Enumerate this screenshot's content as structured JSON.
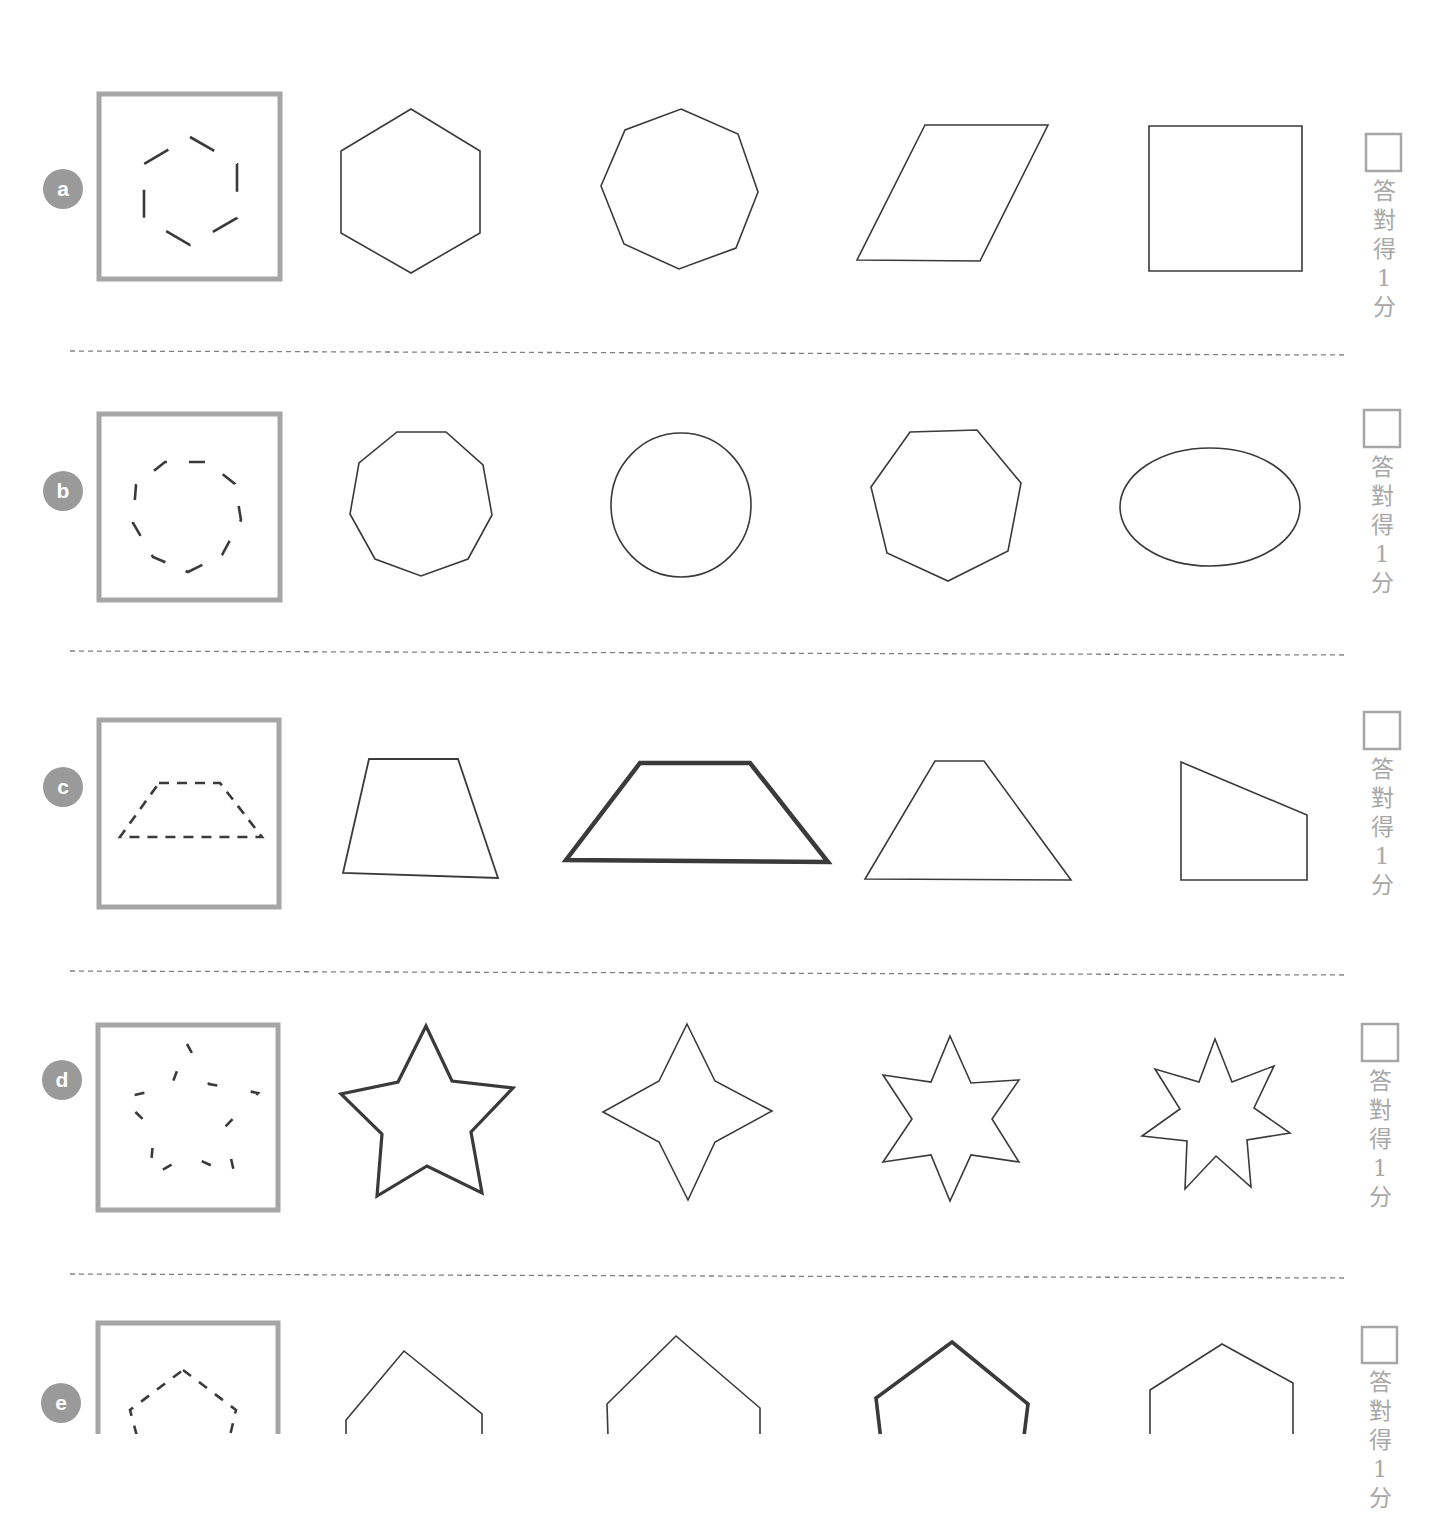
{
  "worksheet": {
    "colors": {
      "frame": "#a6a6a6",
      "badge": "#9a9a9a",
      "stroke": "#3a3a3a",
      "divider": "#808080",
      "score_text": "#a8a8a8",
      "checkbox": "#a6a6a6"
    },
    "score_label_chars": [
      "答",
      "對",
      "得",
      "1",
      "分"
    ],
    "rows": [
      {
        "letter": "a",
        "badge": {
          "cx": 63,
          "cy": 189
        },
        "frame": {
          "x": 99,
          "y": 94,
          "w": 181,
          "h": 185
        },
        "reference": {
          "type": "dashed-hexagon",
          "points": "190,137 237,164 237,218 190,245 144,218 144,164",
          "dash": "28 26"
        },
        "options": [
          {
            "name": "hexagon",
            "type": "polygon",
            "points": "411,109 480,151 480,233 411,273 341,233 341,151",
            "weight": 1.6
          },
          {
            "name": "octagon",
            "type": "polygon",
            "points": "681,109 738,134 758,192 736,248 679,269 624,244 601,186 625,130",
            "weight": 1.6
          },
          {
            "name": "parallelogram",
            "type": "polygon",
            "points": "925,125 1048,125 980,261 857,260",
            "weight": 1.6
          },
          {
            "name": "square",
            "type": "polygon",
            "points": "1149,126 1302,126 1302,271 1149,271",
            "weight": 1.6
          }
        ],
        "checkbox": {
          "x": 1366,
          "y": 134,
          "w": 35,
          "h": 37
        },
        "score_label_y": 177,
        "divider_y": 352
      },
      {
        "letter": "b",
        "badge": {
          "cx": 63,
          "cy": 491
        },
        "frame": {
          "x": 99,
          "y": 414,
          "w": 181,
          "h": 186
        },
        "reference": {
          "type": "dashed-nonagon",
          "points": "188,572 222,555 241,520 235,484 207,462 165,462 136,485 133,523 153,557",
          "dash": "16 22"
        },
        "options": [
          {
            "name": "nonagon",
            "type": "polygon",
            "points": "397,432 446,432 483,465 492,515 468,559 421,576 375,559 350,514 359,463",
            "weight": 1.6
          },
          {
            "name": "circle",
            "type": "ellipse",
            "cx": 681,
            "cy": 505,
            "rx": 70,
            "ry": 72,
            "weight": 1.6
          },
          {
            "name": "heptagon",
            "type": "polygon",
            "points": "910,432 977,430 1021,483 1008,551 948,581 887,553 871,487",
            "weight": 1.6
          },
          {
            "name": "ellipse",
            "type": "ellipse",
            "cx": 1210,
            "cy": 507,
            "rx": 90,
            "ry": 59,
            "weight": 1.6
          }
        ],
        "checkbox": {
          "x": 1364,
          "y": 410,
          "w": 36,
          "h": 37
        },
        "score_label_y": 453,
        "divider_y": 652
      },
      {
        "letter": "c",
        "badge": {
          "cx": 63,
          "cy": 787
        },
        "frame": {
          "x": 99,
          "y": 720,
          "w": 180,
          "h": 187
        },
        "reference": {
          "type": "dashed-trapezoid",
          "points": "159,783 220,783 262,837 120,837",
          "dash": "10 8"
        },
        "options": [
          {
            "name": "irregular-trapezoid",
            "type": "polygon",
            "points": "369,759 458,759 498,878 343,873",
            "weight": 1.8
          },
          {
            "name": "isosceles-trapezoid-bold",
            "type": "polygon",
            "points": "640,763 750,763 828,862 566,860",
            "weight": 4.5
          },
          {
            "name": "tall-trapezoid",
            "type": "polygon",
            "points": "935,761 984,761 1071,880 865,879",
            "weight": 1.6
          },
          {
            "name": "right-trapezoid",
            "type": "polygon",
            "points": "1181,762 1307,815 1307,880 1181,880",
            "weight": 1.6
          }
        ],
        "checkbox": {
          "x": 1364,
          "y": 712,
          "w": 36,
          "h": 37
        },
        "score_label_y": 755,
        "divider_y": 972
      },
      {
        "letter": "d",
        "badge": {
          "cx": 62,
          "cy": 1080
        },
        "frame": {
          "x": 98,
          "y": 1025,
          "w": 180,
          "h": 185
        },
        "reference": {
          "type": "dashed-star-5",
          "points": "187,1044 209,1084 258,1093 224,1128 235,1176 188,1155 150,1177 154,1130 121,1098 171,1087",
          "dash": "10 34"
        },
        "options": [
          {
            "name": "five-point-star",
            "type": "polygon",
            "points": "426,1026 452,1081 513,1088 471,1132 482,1193 427,1166 377,1196 382,1134 341,1094 398,1082",
            "weight": 3.2
          },
          {
            "name": "four-point-star",
            "type": "polygon",
            "points": "687,1024 715,1081 772,1111 715,1142 688,1200 659,1142 603,1112 659,1081",
            "weight": 1.6
          },
          {
            "name": "six-point-star",
            "type": "polygon",
            "points": "950,1036 971,1083 1019,1080 992,1119 1019,1162 971,1155 950,1201 931,1155 883,1162 912,1119 883,1075 931,1082",
            "weight": 1.6
          },
          {
            "name": "seven-point-star",
            "type": "polygon",
            "points": "1215,1039 1232,1082 1274,1066 1254,1108 1290,1133 1247,1140 1251,1187 1216,1156 1185,1189 1187,1141 1142,1136 1180,1109 1155,1069 1199,1082",
            "weight": 1.6
          }
        ],
        "checkbox": {
          "x": 1362,
          "y": 1024,
          "w": 36,
          "h": 37
        },
        "score_label_y": 1067,
        "divider_y": 1275
      },
      {
        "letter": "e",
        "badge": {
          "cx": 61,
          "cy": 1403
        },
        "frame": {
          "x": 98,
          "y": 1323,
          "w": 180,
          "h": 140
        },
        "reference": {
          "type": "dashed-pentagon",
          "points": "183,1370 236,1410 222,1470 146,1470 130,1410",
          "dash": "10 10"
        },
        "options": [
          {
            "name": "pentagon-a",
            "type": "polygon",
            "points": "404,1351 482,1414 482,1500 346,1500 346,1420",
            "weight": 1.6
          },
          {
            "name": "pentagon-b",
            "type": "polygon",
            "points": "676,1336 760,1408 760,1500 610,1500 607,1404",
            "weight": 1.6
          },
          {
            "name": "pentagon-bold",
            "type": "polygon",
            "points": "952,1342 1028,1404 1016,1500 888,1500 876,1398",
            "weight": 3.6
          },
          {
            "name": "pentagon-c",
            "type": "polygon",
            "points": "1222,1344 1293,1383 1293,1500 1150,1500 1150,1390",
            "weight": 1.6
          }
        ],
        "checkbox": {
          "x": 1362,
          "y": 1327,
          "w": 35,
          "h": 36
        },
        "score_label_y": 1368,
        "divider_y": null
      }
    ]
  }
}
